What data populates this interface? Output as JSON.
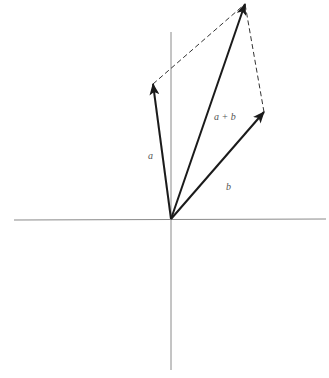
{
  "diagram": {
    "origin": [
      171,
      219
    ],
    "axes": {
      "horizontal": {
        "x1": 14,
        "y1": 220,
        "x2": 326,
        "y2": 219,
        "color": "#8a8a8a"
      },
      "vertical": {
        "x1": 171,
        "y1": 32,
        "x2": 171,
        "y2": 370,
        "color": "#8a8a8a"
      }
    },
    "vectors": [
      {
        "id": "a",
        "label": "a",
        "from": [
          171,
          219
        ],
        "to": [
          153,
          84
        ],
        "color": "#1a1a1a"
      },
      {
        "id": "b",
        "label": "b",
        "from": [
          171,
          219
        ],
        "to": [
          264,
          112
        ],
        "color": "#1a1a1a"
      },
      {
        "id": "a_plus_b",
        "label": "a + b",
        "from": [
          171,
          219
        ],
        "to": [
          245,
          4
        ],
        "color": "#1a1a1a"
      }
    ],
    "dashed_lines": [
      {
        "from": [
          153,
          84
        ],
        "to": [
          245,
          4
        ],
        "color": "#333333"
      },
      {
        "from": [
          264,
          112
        ],
        "to": [
          245,
          4
        ],
        "color": "#333333"
      }
    ],
    "labels": {
      "a": {
        "text": "a",
        "x": 148,
        "y": 151
      },
      "b": {
        "text": "b",
        "x": 226,
        "y": 182
      },
      "a_plus_b": {
        "text": "a + b",
        "x": 214,
        "y": 112
      }
    }
  }
}
